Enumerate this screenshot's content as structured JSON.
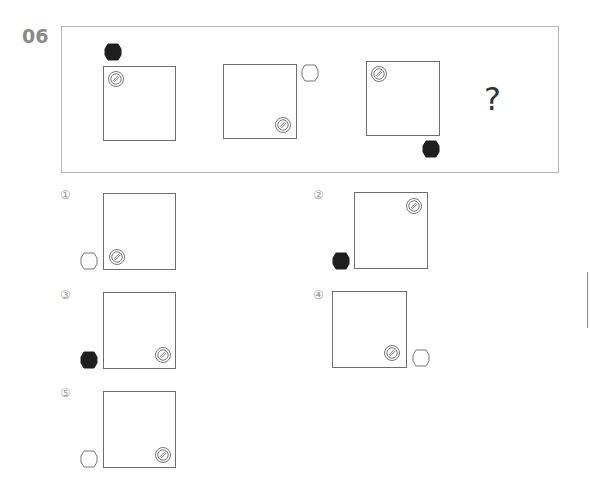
{
  "question": {
    "number": "06",
    "missing_mark": "?"
  },
  "sequence": [
    {
      "panel": 1,
      "hexagon": "black",
      "hexagon_position": "above-top-left",
      "circle_position": "inside-top-left"
    },
    {
      "panel": 2,
      "hexagon": "white",
      "hexagon_position": "right-top",
      "circle_position": "inside-bottom-right"
    },
    {
      "panel": 3,
      "hexagon": "black",
      "hexagon_position": "below-bottom-right",
      "circle_position": "inside-top-left"
    },
    {
      "panel": 4,
      "unknown": true
    }
  ],
  "options": [
    {
      "label": "①",
      "hexagon": "white",
      "hexagon_position": "left-bottom",
      "circle_position": "inside-bottom-left"
    },
    {
      "label": "②",
      "hexagon": "black",
      "hexagon_position": "left-bottom",
      "circle_position": "inside-top-right"
    },
    {
      "label": "③",
      "hexagon": "black",
      "hexagon_position": "left-bottom",
      "circle_position": "inside-bottom-right"
    },
    {
      "label": "④",
      "hexagon": "white",
      "hexagon_position": "right-bottom",
      "circle_position": "inside-bottom-right"
    },
    {
      "label": "⑤",
      "hexagon": "white",
      "hexagon_position": "left-bottom",
      "circle_position": "inside-bottom-right"
    }
  ],
  "icons": {
    "hexagon": "hexagon-icon",
    "circle": "hatched-circle-icon"
  },
  "colors": {
    "hex_fill_black": "#1e1e1e",
    "stroke": "#6e6e6e",
    "label_gray": "#8a8a8a"
  }
}
